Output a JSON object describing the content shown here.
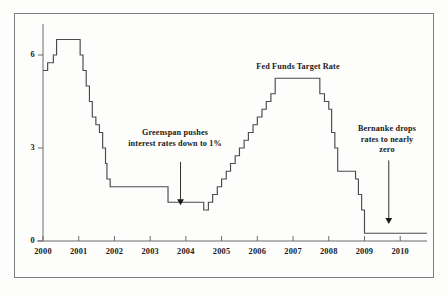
{
  "chart_data": {
    "type": "line",
    "title": "Fed Funds Target Rate",
    "xlabel": "",
    "ylabel": "",
    "xlim": [
      2000.0,
      2010.75
    ],
    "ylim": [
      0,
      7.0
    ],
    "grid": false,
    "legend_position": "none",
    "line_style": "step",
    "x_ticks": [
      "2000",
      "2001",
      "2002",
      "2003",
      "2004",
      "2005",
      "2006",
      "2007",
      "2008",
      "2009",
      "2010"
    ],
    "x_tick_values": [
      2000,
      2001,
      2002,
      2003,
      2004,
      2005,
      2006,
      2007,
      2008,
      2009,
      2010
    ],
    "y_ticks": [
      "0",
      "3",
      "6"
    ],
    "y_tick_values": [
      0,
      3,
      6
    ],
    "series": [
      {
        "name": "Fed Funds Target Rate",
        "x": [
          2000.0,
          2000.13,
          2000.29,
          2000.38,
          2000.46,
          2001.0,
          2001.04,
          2001.12,
          2001.21,
          2001.3,
          2001.38,
          2001.48,
          2001.58,
          2001.67,
          2001.75,
          2001.79,
          2001.88,
          2002.0,
          2002.92,
          2003.5,
          2004.5,
          2004.63,
          2004.75,
          2004.88,
          2005.0,
          2005.13,
          2005.25,
          2005.38,
          2005.5,
          2005.63,
          2005.75,
          2005.88,
          2006.0,
          2006.13,
          2006.25,
          2006.38,
          2006.5,
          2007.63,
          2007.75,
          2007.88,
          2008.0,
          2008.08,
          2008.17,
          2008.25,
          2008.75,
          2008.83,
          2008.92,
          2009.0,
          2010.75
        ],
        "y": [
          5.5,
          5.75,
          6.0,
          6.5,
          6.5,
          6.5,
          6.0,
          5.5,
          5.0,
          4.5,
          4.0,
          3.75,
          3.5,
          3.0,
          2.5,
          2.0,
          1.75,
          1.75,
          1.75,
          1.25,
          1.0,
          1.25,
          1.5,
          1.75,
          2.0,
          2.25,
          2.5,
          2.75,
          3.0,
          3.25,
          3.5,
          3.75,
          4.0,
          4.25,
          4.5,
          4.75,
          5.25,
          5.25,
          4.75,
          4.5,
          4.25,
          3.5,
          3.0,
          2.25,
          2.0,
          1.5,
          1.0,
          0.25,
          0.25
        ]
      }
    ],
    "annotations": [
      {
        "id": "greenspan",
        "lines": [
          "Greenspan pushes",
          "interest rates down to 1%"
        ],
        "arrow_x": 2003.85,
        "arrow_y_top": 2.55,
        "arrow_y_tip": 1.15
      },
      {
        "id": "chart-title",
        "lines": [
          "Fed Funds Target Rate"
        ],
        "arrow_x": null,
        "arrow_y_top": null,
        "arrow_y_tip": null
      },
      {
        "id": "bernanke",
        "lines": [
          "Bernanke drops",
          "rates to nearly",
          "zero"
        ],
        "arrow_x": 2009.68,
        "arrow_y_top": 2.6,
        "arrow_y_tip": 0.55
      }
    ],
    "colors": {
      "line": "#4a4a50",
      "axis": "#6a6a70",
      "frame": "#7c7c82",
      "text": "#1a1a1a",
      "background": "#fdfdfc"
    }
  },
  "caption": {
    "text": ""
  }
}
